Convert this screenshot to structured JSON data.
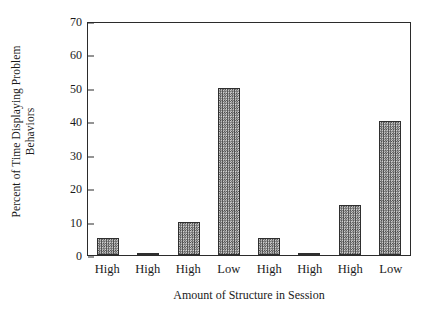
{
  "chart_data": {
    "type": "bar",
    "title": "",
    "categories": [
      "High",
      "High",
      "High",
      "Low",
      "High",
      "High",
      "High",
      "Low"
    ],
    "values": [
      5,
      0.5,
      10,
      50,
      5,
      0.5,
      15,
      40
    ],
    "xlabel": "Amount of Structure in Session",
    "ylabel": "Percent of Time Displaying Problem Behaviors",
    "ylabel_lines": [
      "Percent of Time Displaying Problem",
      "Behaviors"
    ],
    "ylim": [
      0,
      70
    ],
    "yticks": [
      0,
      10,
      20,
      30,
      40,
      50,
      60,
      70
    ],
    "ytick_labels": [
      "0",
      "10",
      "20",
      "30",
      "40",
      "50",
      "60",
      "70"
    ],
    "grid": false,
    "legend": "none",
    "bar_fill": "#7a7a7a",
    "bar_edge": "#2f2f2f",
    "axis_color": "#2b2b2b",
    "background": "#ffffff"
  }
}
